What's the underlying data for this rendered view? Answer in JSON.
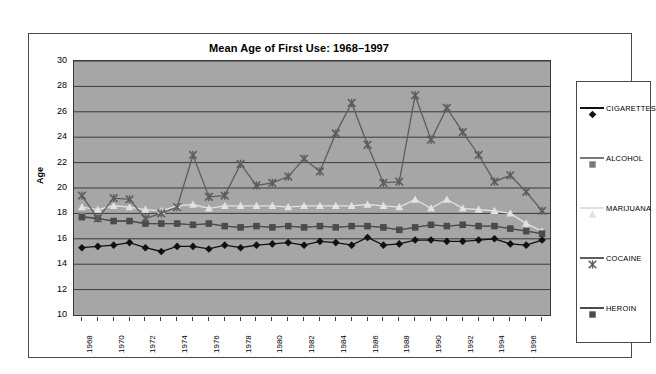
{
  "chart_data": {
    "type": "line",
    "title": "Mean Age of First Use: 1968–1997",
    "xlabel": "",
    "ylabel": "Age",
    "ylim": [
      10,
      30
    ],
    "ytick_step": 2,
    "yticks": [
      30,
      28,
      26,
      24,
      22,
      20,
      18,
      16,
      14,
      12,
      10
    ],
    "grid": true,
    "legend_position": "right",
    "x": [
      1968,
      1969,
      1970,
      1971,
      1972,
      1973,
      1974,
      1975,
      1976,
      1977,
      1978,
      1979,
      1980,
      1981,
      1982,
      1983,
      1984,
      1985,
      1986,
      1987,
      1988,
      1989,
      1990,
      1991,
      1992,
      1993,
      1994,
      1995,
      1996,
      1997
    ],
    "xtick_labels": [
      "1968",
      "1970",
      "1972",
      "1974",
      "1976",
      "1978",
      "1980",
      "1982",
      "1984",
      "1986",
      "1988",
      "1990",
      "1992",
      "1994",
      "1996"
    ],
    "series": [
      {
        "name": "CIGARETTES",
        "color": "#111111",
        "marker": "diamond",
        "values": [
          15.3,
          15.4,
          15.5,
          15.7,
          15.3,
          15.0,
          15.4,
          15.4,
          15.2,
          15.5,
          15.3,
          15.5,
          15.6,
          15.7,
          15.5,
          15.8,
          15.7,
          15.5,
          16.1,
          15.5,
          15.6,
          15.9,
          15.9,
          15.8,
          15.8,
          15.9,
          16.0,
          15.6,
          15.5,
          15.9
        ]
      },
      {
        "name": "ALCOHOL",
        "color": "#7a7a7a",
        "marker": "square",
        "values": [
          17.8,
          17.6,
          17.4,
          17.4,
          17.2,
          17.2,
          17.2,
          17.1,
          17.2,
          17.0,
          16.9,
          17.0,
          16.9,
          17.0,
          16.9,
          17.0,
          16.9,
          17.0,
          17.0,
          16.9,
          16.7,
          16.9,
          17.1,
          17.0,
          17.1,
          17.0,
          17.0,
          16.8,
          16.6,
          16.4
        ]
      },
      {
        "name": "MARIJUANA",
        "color": "#e2e2e2",
        "marker": "triangle",
        "values": [
          18.5,
          18.3,
          18.6,
          18.5,
          18.3,
          18.2,
          18.6,
          18.7,
          18.4,
          18.6,
          18.6,
          18.6,
          18.6,
          18.5,
          18.6,
          18.6,
          18.6,
          18.6,
          18.7,
          18.6,
          18.5,
          19.1,
          18.4,
          19.1,
          18.4,
          18.3,
          18.2,
          18.0,
          17.2,
          16.6
        ]
      },
      {
        "name": "COCAINE",
        "color": "#5d5d5d",
        "marker": "cross",
        "values": [
          19.4,
          17.6,
          19.2,
          19.1,
          17.6,
          18.0,
          18.5,
          22.6,
          19.3,
          19.4,
          21.9,
          20.2,
          20.4,
          20.9,
          22.3,
          21.3,
          24.3,
          26.7,
          23.4,
          20.4,
          20.5,
          27.3,
          23.8,
          26.3,
          24.4,
          22.6,
          20.5,
          21.0,
          19.7,
          18.2
        ]
      },
      {
        "name": "HEROIN",
        "color": "#4b4b4b",
        "marker": "square",
        "values": [
          17.7,
          17.6,
          17.4,
          17.4,
          17.2,
          17.2,
          17.2,
          17.1,
          17.2,
          17.0,
          16.9,
          17.0,
          16.9,
          17.0,
          16.9,
          17.0,
          16.9,
          17.0,
          17.0,
          16.9,
          16.7,
          16.9,
          17.1,
          17.0,
          17.1,
          17.0,
          17.0,
          16.8,
          16.6,
          16.4
        ]
      }
    ]
  },
  "legend": {
    "items": [
      {
        "label": "CIGARETTES"
      },
      {
        "label": "ALCOHOL"
      },
      {
        "label": "MARIJUANA"
      },
      {
        "label": "COCAINE"
      },
      {
        "label": "HEROIN"
      }
    ]
  }
}
